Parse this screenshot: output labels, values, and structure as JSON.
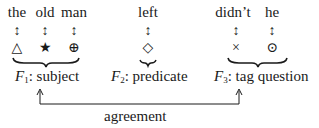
{
  "words": [
    {
      "text": "the",
      "x": 17
    },
    {
      "text": "old",
      "x": 45
    },
    {
      "text": "man",
      "x": 74
    },
    {
      "text": "left",
      "x": 148
    },
    {
      "text": "didn’t",
      "x": 233
    },
    {
      "text": "he",
      "x": 272
    }
  ],
  "arrow_glyph": "↕",
  "symbols": [
    {
      "glyph": "△",
      "name": "triangle",
      "x": 17
    },
    {
      "glyph": "★",
      "name": "star",
      "x": 45
    },
    {
      "glyph": "⊕",
      "name": "circled-plus",
      "x": 74
    },
    {
      "glyph": "◇",
      "name": "diamond",
      "x": 148
    },
    {
      "glyph": "×",
      "name": "cross",
      "x": 236
    },
    {
      "glyph": "⊙",
      "name": "circled-dot",
      "x": 272
    }
  ],
  "functions": [
    {
      "var": "F",
      "sub": "1",
      "label": ": subject"
    },
    {
      "var": "F",
      "sub": "2",
      "label": ": predicate"
    },
    {
      "var": "F",
      "sub": "3",
      "label": ": tag question"
    }
  ],
  "agreement_label": "agreement"
}
